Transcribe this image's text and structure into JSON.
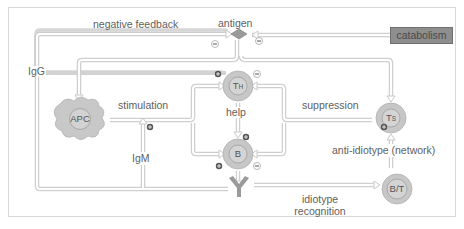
{
  "diagram": {
    "nodes": {
      "antigen": {
        "label": "antigen"
      },
      "catabolism": {
        "label": "catabolism"
      },
      "apc": {
        "label": "APC"
      },
      "th": {
        "label": "T",
        "sub": "H"
      },
      "b": {
        "label": "B"
      },
      "ts": {
        "label": "T",
        "sub": "S"
      },
      "bt": {
        "label": "B/T"
      },
      "antibody": {
        "label": ""
      }
    },
    "edges": {
      "negative_feedback": "negative feedback",
      "igg": "IgG",
      "igm": "IgM",
      "stimulation": "stimulation",
      "help": "help",
      "suppression": "suppression",
      "anti_idiotype": "anti-idiotype (network)",
      "idiotype_recognition_1": "idiotype",
      "idiotype_recognition_2": "recognition"
    },
    "signs": {
      "plus": "+",
      "minus": "−"
    },
    "colors": {
      "line": "#d9d9d9",
      "cell_outer": "#c9c9c9",
      "cell_inner": "#d6d6d6",
      "catabolism_fill": "#8e8e8e",
      "apc_fill": "#c8c8c8",
      "antibody": "#9a9a9a"
    }
  }
}
